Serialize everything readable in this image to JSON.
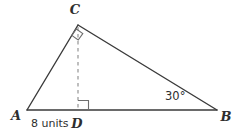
{
  "figure": {
    "kind": "geometry-triangle-with-altitude",
    "background_color": "#ffffff",
    "stroke_color": "#3a3a3a",
    "dashed_stroke_color": "#8a8a8a",
    "label_color": "#2e2e2e",
    "width": 244,
    "height": 134
  },
  "labels": {
    "vertex_a": "A",
    "vertex_b": "B",
    "vertex_c": "C",
    "vertex_d": "D",
    "segment_ad_measure": "8 units",
    "angle_b_measure": "30°"
  },
  "geometry": {
    "points": {
      "A": {
        "x": 27,
        "y": 110
      },
      "B": {
        "x": 217,
        "y": 110
      },
      "C": {
        "x": 78,
        "y": 25
      },
      "D": {
        "x": 78,
        "y": 110
      }
    },
    "segments": [
      {
        "name": "AC",
        "from": "A",
        "to": "C",
        "style": "solid"
      },
      {
        "name": "CB",
        "from": "C",
        "to": "B",
        "style": "solid"
      },
      {
        "name": "AB",
        "from": "A",
        "to": "B",
        "style": "solid"
      },
      {
        "name": "CD",
        "from": "C",
        "to": "D",
        "style": "dashed"
      }
    ],
    "right_angles": [
      {
        "name": "angle-at-c",
        "at": "C",
        "between": [
          "CA",
          "CD"
        ]
      },
      {
        "name": "angle-at-d",
        "at": "D",
        "between": [
          "DC",
          "DB"
        ]
      }
    ]
  },
  "label_positions": {
    "vertex_a": {
      "x": 16,
      "y": 120
    },
    "vertex_b": {
      "x": 225,
      "y": 121
    },
    "vertex_c": {
      "x": 75,
      "y": 14
    },
    "vertex_d": {
      "x": 77,
      "y": 128
    },
    "segment_ad_measure": {
      "x": 31,
      "y": 127
    },
    "angle_b_measure": {
      "x": 165,
      "y": 100
    }
  }
}
